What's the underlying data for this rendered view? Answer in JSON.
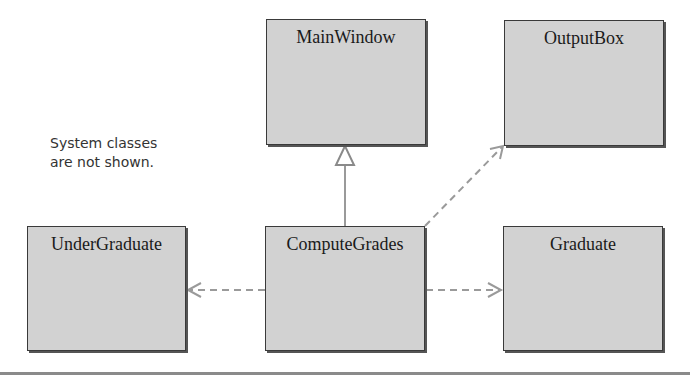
{
  "diagram": {
    "classes": {
      "main_window": "MainWindow",
      "output_box": "OutputBox",
      "under_graduate": "UnderGraduate",
      "compute_grades": "ComputeGrades",
      "graduate": "Graduate"
    },
    "note": {
      "line1": "System classes",
      "line2": "are not shown."
    },
    "relationships": [
      {
        "from": "ComputeGrades",
        "to": "MainWindow",
        "type": "inheritance",
        "style": "solid-hollow-triangle"
      },
      {
        "from": "ComputeGrades",
        "to": "OutputBox",
        "type": "dependency",
        "style": "dashed-open-arrow"
      },
      {
        "from": "ComputeGrades",
        "to": "UnderGraduate",
        "type": "dependency",
        "style": "dashed-open-arrow"
      },
      {
        "from": "ComputeGrades",
        "to": "Graduate",
        "type": "dependency",
        "style": "dashed-open-arrow"
      }
    ],
    "colors": {
      "box_fill": "#d2d2d2",
      "box_border": "#3a3a3a",
      "connector": "#9a9a9a"
    }
  }
}
